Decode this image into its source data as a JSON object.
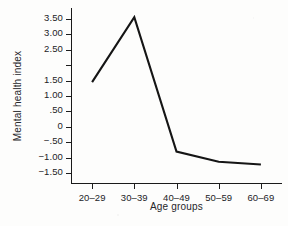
{
  "chart_data": {
    "type": "line",
    "title": "",
    "xlabel": "Age groups",
    "ylabel": "Mental health index",
    "categories": [
      "20–29",
      "30–39",
      "40–49",
      "50–59",
      "60–69"
    ],
    "values": [
      1.45,
      3.55,
      -0.8,
      -1.13,
      -1.22
    ],
    "series": [
      {
        "name": "Mental health index",
        "values": [
          1.45,
          3.55,
          -0.8,
          -1.13,
          -1.22
        ],
        "color": "#151515"
      }
    ],
    "ylim": [
      -1.85,
      3.85
    ],
    "ytick_values": [
      3.5,
      3.0,
      2.5,
      2.0,
      1.5,
      1.0,
      0.5,
      0.0,
      -0.5,
      -1.0,
      -1.5
    ],
    "ytick_labels": [
      "3.50",
      "3.00",
      "2.50",
      "",
      "1.50",
      "1.00",
      ".50",
      "0",
      "−.50",
      "−1.00",
      "−1.50"
    ],
    "grid": false,
    "legend": false,
    "legend_position": "none",
    "markers": false,
    "line_color": "#151515",
    "axis_color": "#1a1a1a",
    "background": "#fdfdfc"
  }
}
